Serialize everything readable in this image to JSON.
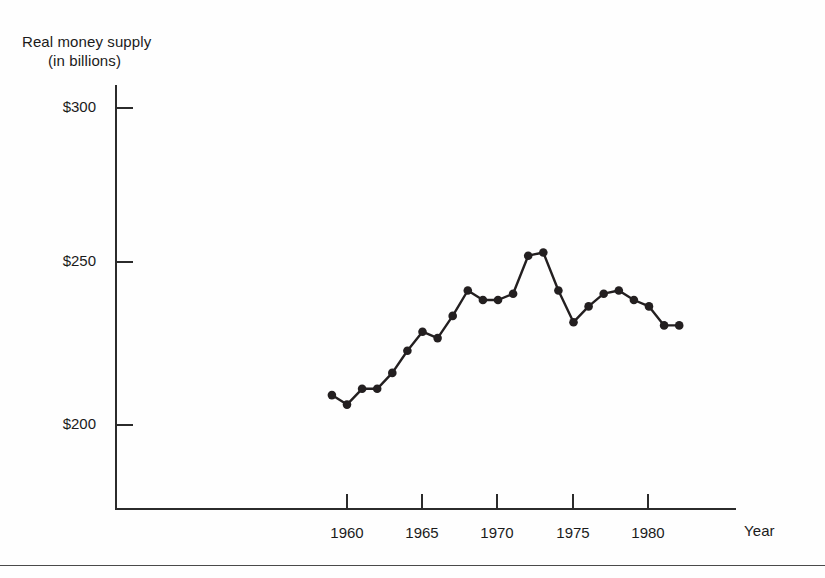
{
  "chart_data": {
    "type": "line",
    "title": "",
    "ylabel": "Real money supply (in billions)",
    "ylabel_line1": "Real money supply",
    "ylabel_line2": "(in billions)",
    "xlabel": "Year",
    "xlim": [
      1957.5,
      1983.5
    ],
    "ylim": [
      188,
      305
    ],
    "grid": false,
    "legend": null,
    "ytick_labels": [
      "$300",
      "$250",
      "$200"
    ],
    "ytick_values": [
      300,
      250,
      200
    ],
    "xtick_labels": [
      "1960",
      "1965",
      "1970",
      "1975",
      "1980"
    ],
    "xtick_values": [
      1960,
      1965,
      1970,
      1975,
      1980
    ],
    "x": [
      1959,
      1960,
      1961,
      1962,
      1963,
      1964,
      1965,
      1966,
      1967,
      1968,
      1969,
      1970,
      1971,
      1972,
      1973,
      1974,
      1975,
      1976,
      1977,
      1978,
      1979,
      1980,
      1981,
      1982
    ],
    "values": [
      208,
      205,
      210,
      210,
      215,
      222,
      228,
      226,
      233,
      241,
      238,
      238,
      240,
      252,
      253,
      241,
      231,
      236,
      240,
      241,
      238,
      236,
      230,
      230
    ],
    "marker": "circle",
    "marker_color": "#231f20",
    "line_color": "#231f20",
    "line_width": 2.2,
    "series": [
      {
        "name": "Real money supply",
        "values": [
          208,
          205,
          210,
          210,
          215,
          222,
          228,
          226,
          233,
          241,
          238,
          238,
          240,
          252,
          253,
          241,
          231,
          236,
          240,
          241,
          238,
          236,
          230,
          230
        ]
      }
    ]
  },
  "axes": {
    "y_axis_name": "y-axis",
    "x_axis_name": "x-axis"
  },
  "footer": {
    "rule": ""
  }
}
